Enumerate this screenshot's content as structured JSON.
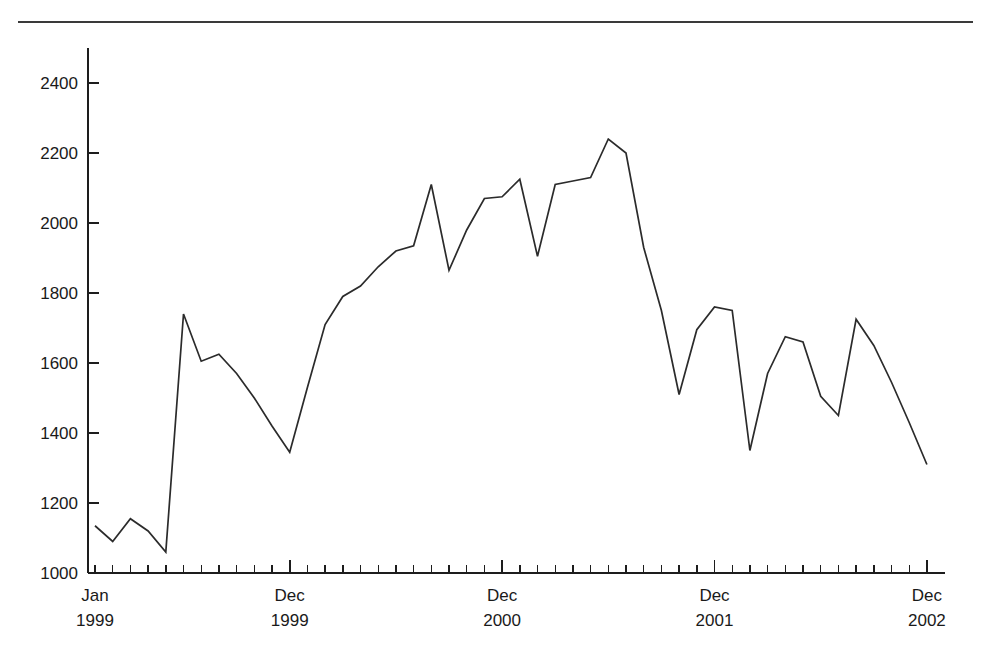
{
  "figure": {
    "rule_color": "#3a3a3a",
    "line_color": "#2b2b2b",
    "axis_color": "#1d1d1d",
    "background": "#ffffff"
  },
  "chart_data": {
    "type": "line",
    "title": "",
    "xlabel": "",
    "ylabel": "",
    "ylim": [
      1000,
      2500
    ],
    "yticks": [
      1000,
      1200,
      1400,
      1600,
      1800,
      2000,
      2200,
      2400
    ],
    "ytick_labels": [
      "1000",
      "1200",
      "1400",
      "1600",
      "1800",
      "2000",
      "2200",
      "2400"
    ],
    "grid": false,
    "legend": "none",
    "xtick_labels": [
      {
        "line1": "Jan",
        "line2": "1999",
        "index": 0,
        "major": true
      },
      {
        "line1": "Dec",
        "line2": "1999",
        "index": 11,
        "major": true
      },
      {
        "line1": "Dec",
        "line2": "2000",
        "index": 23,
        "major": true
      },
      {
        "line1": "Dec",
        "line2": "2001",
        "index": 35,
        "major": true
      },
      {
        "line1": "Dec",
        "line2": "2002",
        "index": 47,
        "major": true
      }
    ],
    "x": [
      "Jan 1999",
      "Feb 1999",
      "Mar 1999",
      "Apr 1999",
      "May 1999",
      "Jun 1999",
      "Jul 1999",
      "Aug 1999",
      "Sep 1999",
      "Oct 1999",
      "Nov 1999",
      "Dec 1999",
      "Jan 2000",
      "Feb 2000",
      "Mar 2000",
      "Apr 2000",
      "May 2000",
      "Jun 2000",
      "Jul 2000",
      "Aug 2000",
      "Sep 2000",
      "Oct 2000",
      "Nov 2000",
      "Dec 2000",
      "Jan 2001",
      "Feb 2001",
      "Mar 2001",
      "Apr 2001",
      "May 2001",
      "Jun 2001",
      "Jul 2001",
      "Aug 2001",
      "Sep 2001",
      "Oct 2001",
      "Nov 2001",
      "Dec 2001",
      "Jan 2002",
      "Feb 2002",
      "Mar 2002",
      "Apr 2002",
      "May 2002",
      "Jun 2002",
      "Jul 2002",
      "Aug 2002",
      "Sep 2002",
      "Oct 2002",
      "Nov 2002",
      "Dec 2002"
    ],
    "values": [
      1135,
      1090,
      1155,
      1120,
      1060,
      1740,
      1605,
      1625,
      1570,
      1500,
      1420,
      1345,
      1530,
      1710,
      1790,
      1820,
      1875,
      1920,
      1935,
      2110,
      1865,
      1980,
      2070,
      2075,
      2125,
      1905,
      2110,
      2120,
      2130,
      2240,
      2200,
      1930,
      1750,
      1510,
      1695,
      1760,
      1750,
      1350,
      1570,
      1675,
      1660,
      1505,
      1450,
      1725,
      1650,
      1545,
      1430,
      1310
    ]
  }
}
